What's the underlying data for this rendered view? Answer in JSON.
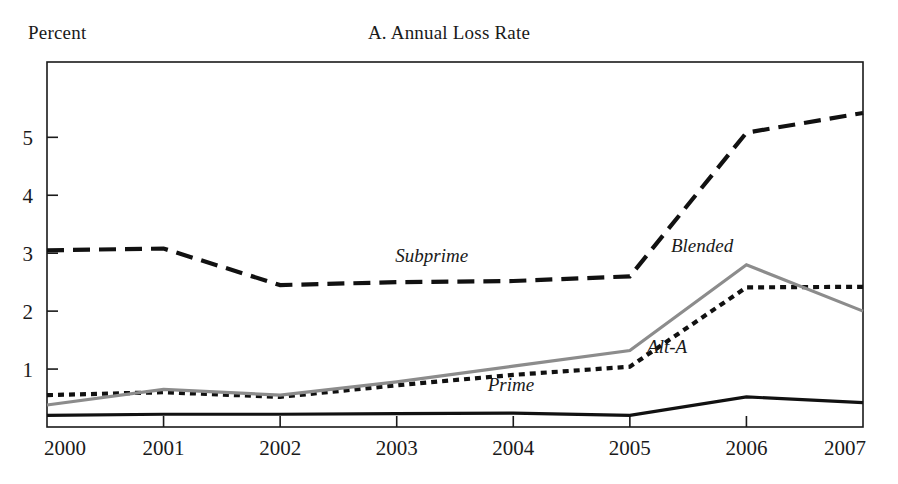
{
  "figure": {
    "axis_unit_label": "Percent",
    "title": "A. Annual Loss Rate"
  },
  "chart_data": {
    "type": "line",
    "title": "A. Annual Loss Rate",
    "xlabel": "",
    "ylabel": "Percent",
    "x": [
      2000,
      2001,
      2002,
      2003,
      2004,
      2005,
      2006,
      2007
    ],
    "xtick_labels": [
      "2000",
      "2001",
      "2002",
      "2003",
      "2004",
      "2005",
      "2006",
      "2007"
    ],
    "ytick_labels": [
      "1",
      "2",
      "3",
      "4",
      "5"
    ],
    "yticks": [
      1,
      2,
      3,
      4,
      5
    ],
    "xlim": [
      2000,
      2007
    ],
    "ylim": [
      0,
      6.3
    ],
    "grid": false,
    "legend_position": "inline-annotations",
    "series": [
      {
        "name": "Subprime",
        "style": "dashed",
        "color": "#111111",
        "values": [
          3.05,
          3.08,
          2.45,
          2.5,
          2.52,
          2.6,
          5.08,
          5.42
        ],
        "label": "Subprime",
        "label_x": 2003.3,
        "label_y": 2.84
      },
      {
        "name": "Alt-A",
        "style": "dotted",
        "color": "#111111",
        "values": [
          0.55,
          0.6,
          0.52,
          0.72,
          0.9,
          1.04,
          2.41,
          2.42
        ],
        "label": "Alt-A",
        "label_x": 2005.32,
        "label_y": 1.28
      },
      {
        "name": "Blended",
        "style": "solid",
        "color": "#8c8c8c",
        "values": [
          0.38,
          0.65,
          0.55,
          0.78,
          1.05,
          1.32,
          2.8,
          2.0
        ],
        "label": "Blended",
        "label_x": 2005.62,
        "label_y": 3.02
      },
      {
        "name": "Prime",
        "style": "solid",
        "color": "#111111",
        "values": [
          0.2,
          0.22,
          0.22,
          0.23,
          0.24,
          0.2,
          0.52,
          0.42
        ],
        "label": "Prime",
        "label_x": 2003.98,
        "label_y": 0.62
      }
    ]
  }
}
